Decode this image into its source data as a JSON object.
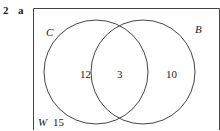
{
  "question": {
    "number": "2",
    "part": "a"
  },
  "venn": {
    "universal_label": "W",
    "sets": [
      {
        "label": "C"
      },
      {
        "label": "B"
      }
    ],
    "regions": {
      "only_C": "12",
      "both": "3",
      "only_B": "10",
      "outside": "15"
    }
  }
}
